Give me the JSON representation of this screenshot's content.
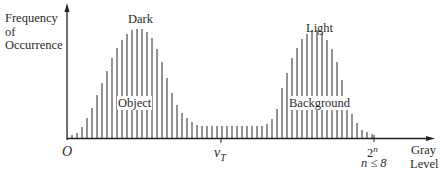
{
  "diagram": {
    "y_axis_label": [
      "Frequency",
      "of",
      "Occurrence"
    ],
    "x_axis_label": [
      "Gray",
      "Level"
    ],
    "origin_label": "O",
    "threshold_label": "v",
    "threshold_subscript": "T",
    "max_level_label": "2",
    "max_level_superscript": "n",
    "bit_constraint": "n ≤ 8",
    "peak_labels": {
      "left_top": "Dark",
      "left_inner": "Object",
      "right_top": "Light",
      "right_inner": "Background"
    },
    "colors": {
      "bars": "#3a3a3a",
      "axes": "#222222",
      "background": "#ffffff"
    }
  },
  "chart_data": {
    "type": "bar",
    "title": "",
    "xlabel": "Gray Level",
    "ylabel": "Frequency of Occurrence",
    "x_ticks": [
      "O",
      "v_T",
      "2^n"
    ],
    "annotations": [
      "Dark",
      "Object",
      "Light",
      "Background",
      "n ≤ 8"
    ],
    "bar_positions": [
      72,
      77,
      82,
      87,
      92,
      97,
      102,
      107,
      112,
      117,
      122,
      127,
      132,
      137,
      142,
      147,
      152,
      157,
      162,
      167,
      172,
      177,
      182,
      187,
      192,
      197,
      202,
      207,
      212,
      217,
      222,
      227,
      232,
      237,
      242,
      247,
      252,
      257,
      262,
      267,
      272,
      277,
      282,
      287,
      292,
      297,
      302,
      307,
      312,
      317,
      322,
      327,
      332,
      337,
      342,
      347,
      352,
      357,
      362,
      367,
      372
    ],
    "bar_heights": [
      3,
      5,
      11,
      20,
      30,
      43,
      55,
      67,
      80,
      90,
      98,
      104,
      108,
      109,
      109,
      106,
      100,
      89,
      76,
      60,
      45,
      33,
      25,
      20,
      16,
      13,
      12,
      12,
      12,
      12,
      12,
      12,
      12,
      12,
      12,
      12,
      12,
      12,
      12,
      14,
      19,
      29,
      50,
      65,
      80,
      90,
      99,
      104,
      108,
      108,
      105,
      98,
      89,
      76,
      58,
      38,
      24,
      15,
      8,
      6,
      4
    ],
    "baseline_y": 138,
    "grid": false
  }
}
